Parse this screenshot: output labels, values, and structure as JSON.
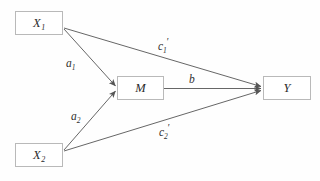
{
  "diagram": {
    "type": "path-diagram",
    "title": "",
    "background_color": "#fefefe",
    "box_border_color": "#b9b9b9",
    "line_color": "#555555",
    "text_color": "#2b2b2b",
    "nodes": [
      {
        "id": "x1",
        "label": "X",
        "subscript": "1",
        "name": "node-x1"
      },
      {
        "id": "x2",
        "label": "X",
        "subscript": "2",
        "name": "node-x2"
      },
      {
        "id": "m",
        "label": "M",
        "subscript": "",
        "name": "node-m"
      },
      {
        "id": "y",
        "label": "Y",
        "subscript": "",
        "name": "node-y"
      }
    ],
    "edges": [
      {
        "id": "a1",
        "from": "X1",
        "to": "M",
        "label": "a",
        "subscript": "1",
        "prime": ""
      },
      {
        "id": "a2",
        "from": "X2",
        "to": "M",
        "label": "a",
        "subscript": "2",
        "prime": ""
      },
      {
        "id": "b",
        "from": "M",
        "to": "Y",
        "label": "b",
        "subscript": "",
        "prime": ""
      },
      {
        "id": "c1p",
        "from": "X1",
        "to": "Y",
        "label": "c",
        "subscript": "1",
        "prime": "′"
      },
      {
        "id": "c2p",
        "from": "X2",
        "to": "Y",
        "label": "c",
        "subscript": "2",
        "prime": "′"
      }
    ]
  }
}
